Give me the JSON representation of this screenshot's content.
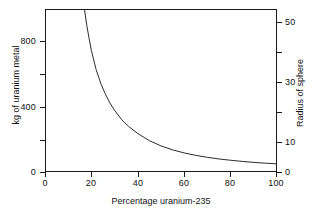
{
  "chart_data": {
    "type": "line",
    "title": "",
    "xlabel": "Percentage uranium-235",
    "ylabel": "kg of uranium metal",
    "y2label": "Radius of sphere",
    "xlim": [
      0,
      100
    ],
    "ylim": [
      0,
      1000
    ],
    "y2lim": [
      0,
      54
    ],
    "grid": false,
    "legend": "none",
    "xticks": [
      0,
      20,
      40,
      60,
      80,
      100
    ],
    "xtick_labels": [
      "0",
      "20",
      "40",
      "60",
      "80",
      "100"
    ],
    "yticks": [
      0,
      200,
      400,
      600,
      800
    ],
    "ytick_labels": [
      "0",
      "",
      "400",
      "",
      "800"
    ],
    "y2ticks": [
      0,
      10,
      20,
      30,
      40,
      50
    ],
    "y2tick_labels": [
      "0",
      "10",
      "",
      "30",
      "",
      "50"
    ],
    "series": [
      {
        "name": "critical mass of uranium metal",
        "x": [
          17,
          18,
          19,
          20,
          22,
          24,
          26,
          28,
          30,
          33,
          36,
          40,
          45,
          50,
          55,
          60,
          65,
          70,
          75,
          80,
          85,
          90,
          95,
          100
        ],
        "values": [
          1000,
          900,
          820,
          745,
          630,
          545,
          478,
          423,
          378,
          322,
          280,
          236,
          192,
          160,
          136,
          117,
          102,
          90,
          80,
          72,
          65,
          59,
          54,
          50
        ]
      }
    ],
    "annotations": []
  },
  "axes": {
    "left": {
      "title": "kg of uranium metal",
      "labels": [
        {
          "text": "800",
          "value": 800
        },
        {
          "text": "400",
          "value": 400
        },
        {
          "text": "0",
          "value": 0
        }
      ]
    },
    "right": {
      "title": "Radius of sphere",
      "labels": [
        {
          "text": "50",
          "value": 50
        },
        {
          "text": "30",
          "value": 30
        },
        {
          "text": "10",
          "value": 10
        },
        {
          "text": "0",
          "value": 0
        }
      ]
    },
    "bottom": {
      "title": "Percentage uranium-235",
      "labels": [
        {
          "text": "0",
          "value": 0
        },
        {
          "text": "20",
          "value": 20
        },
        {
          "text": "40",
          "value": 40
        },
        {
          "text": "60",
          "value": 60
        },
        {
          "text": "80",
          "value": 80
        },
        {
          "text": "100",
          "value": 100
        }
      ]
    }
  },
  "style": {
    "curve_color": "#2b2b2b",
    "axis_color": "#1a1a1a",
    "background": "#ffffff"
  }
}
